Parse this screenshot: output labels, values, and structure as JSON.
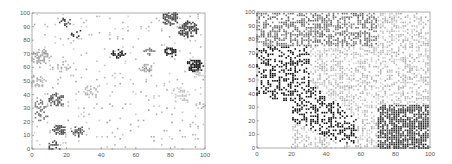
{
  "chart_data": [
    {
      "type": "scatter",
      "title": "",
      "xlabel": "",
      "ylabel": "",
      "xlim": [
        0,
        100
      ],
      "ylim": [
        0,
        100
      ],
      "xticks": [
        0,
        20,
        40,
        60,
        80,
        100
      ],
      "yticks": [
        0,
        10,
        20,
        30,
        40,
        50,
        60,
        70,
        80,
        90,
        100
      ],
      "grid": false,
      "legend": null,
      "marker": "small square",
      "colormap": "grayscale (darker = higher value)",
      "description": "Sparse clustered points; dark dense clusters at upper right, medium clusters lower left, light scattered points elsewhere",
      "clusters": [
        {
          "cx": 80,
          "cy": 96,
          "r": 5,
          "shade": 0.35,
          "density": 0.85
        },
        {
          "cx": 90,
          "cy": 88,
          "r": 6,
          "shade": 0.3,
          "density": 0.85
        },
        {
          "cx": 80,
          "cy": 71,
          "r": 4,
          "shade": 0.15,
          "density": 0.8
        },
        {
          "cx": 94,
          "cy": 61,
          "r": 5,
          "shade": 0.1,
          "density": 0.85
        },
        {
          "cx": 50,
          "cy": 70,
          "r": 4,
          "shade": 0.15,
          "density": 0.8
        },
        {
          "cx": 68,
          "cy": 72,
          "r": 3,
          "shade": 0.55,
          "density": 0.6
        },
        {
          "cx": 66,
          "cy": 59,
          "r": 4,
          "shade": 0.7,
          "density": 0.55
        },
        {
          "cx": 14,
          "cy": 36,
          "r": 5,
          "shade": 0.4,
          "density": 0.75
        },
        {
          "cx": 5,
          "cy": 32,
          "r": 4,
          "shade": 0.55,
          "density": 0.7
        },
        {
          "cx": 5,
          "cy": 24,
          "r": 4,
          "shade": 0.5,
          "density": 0.65
        },
        {
          "cx": 16,
          "cy": 14,
          "r": 4,
          "shade": 0.35,
          "density": 0.8
        },
        {
          "cx": 27,
          "cy": 13,
          "r": 4,
          "shade": 0.4,
          "density": 0.75
        },
        {
          "cx": 13,
          "cy": 2,
          "r": 4,
          "shade": 0.35,
          "density": 0.7
        },
        {
          "cx": 5,
          "cy": 68,
          "r": 6,
          "shade": 0.7,
          "density": 0.55
        },
        {
          "cx": 3,
          "cy": 50,
          "r": 5,
          "shade": 0.75,
          "density": 0.5
        },
        {
          "cx": 35,
          "cy": 42,
          "r": 5,
          "shade": 0.8,
          "density": 0.45
        },
        {
          "cx": 18,
          "cy": 60,
          "r": 4,
          "shade": 0.75,
          "density": 0.4
        },
        {
          "cx": 25,
          "cy": 85,
          "r": 4,
          "shade": 0.2,
          "density": 0.35
        },
        {
          "cx": 20,
          "cy": 93,
          "r": 4,
          "shade": 0.3,
          "density": 0.35
        },
        {
          "cx": 85,
          "cy": 40,
          "r": 6,
          "shade": 0.85,
          "density": 0.35
        },
        {
          "cx": 97,
          "cy": 55,
          "r": 4,
          "shade": 0.85,
          "density": 0.4
        },
        {
          "cx": 97,
          "cy": 32,
          "r": 3,
          "shade": 0.75,
          "density": 0.4
        }
      ],
      "background_density": 0.06,
      "background_shade": 0.8,
      "seed": 17
    },
    {
      "type": "scatter",
      "title": "",
      "xlabel": "",
      "ylabel": "",
      "xlim": [
        0,
        100
      ],
      "ylim": [
        0,
        100
      ],
      "xticks": [
        0,
        20,
        40,
        60,
        80,
        100
      ],
      "yticks": [
        0,
        10,
        20,
        30,
        40,
        50,
        60,
        70,
        80,
        90,
        100
      ],
      "grid": false,
      "legend": null,
      "marker": "small square",
      "colormap": "grayscale (darker = higher value)",
      "description": "Dense points covering whole domain; black region left-middle diagonal band, dark gray top-left and bottom-right, light gray center/right, empty bottom-left",
      "regions": [
        {
          "name": "top-left",
          "shade": 0.5,
          "density": 0.55
        },
        {
          "name": "left-middle-black",
          "shade": 0.05,
          "density": 0.4
        },
        {
          "name": "bottom-right-dark",
          "shade": 0.25,
          "density": 0.75
        },
        {
          "name": "center-light",
          "shade": 0.82,
          "density": 0.45
        },
        {
          "name": "bottom-left-empty",
          "shade": 1.0,
          "density": 0.0
        }
      ],
      "seed": 29
    }
  ],
  "panels": [
    {
      "id": "left",
      "x_offset": 0
    },
    {
      "id": "right",
      "x_offset": 226
    }
  ]
}
